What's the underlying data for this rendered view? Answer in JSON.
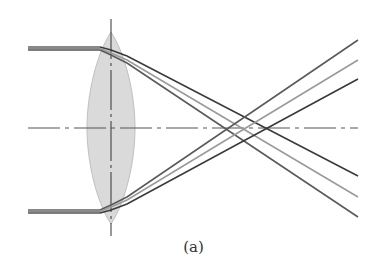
{
  "figure": {
    "caption": "(a)",
    "colors": {
      "lens_fill": "#d4d4d4",
      "lens_stroke": "#b0b0b0",
      "axis": "#555555",
      "incident_beam": "#707070",
      "ray_dark": "#3a3a3a",
      "ray_light": "#9a9a9a",
      "ray_mid": "#5a5a5a"
    },
    "optical_axis": {
      "y": 128,
      "x_start": 28,
      "x_end": 358
    },
    "lens": {
      "cx": 111,
      "cy": 128,
      "rx": 24,
      "ry": 96
    },
    "incident_beams": [
      {
        "name": "top",
        "y": 48,
        "x_start": 28,
        "x_end": 100
      },
      {
        "name": "bottom",
        "y": 211,
        "x_start": 28,
        "x_end": 100
      }
    ],
    "rays": [
      {
        "from": "top",
        "end": [
          358,
          176
        ],
        "tone": "dark"
      },
      {
        "from": "top",
        "end": [
          358,
          197
        ],
        "tone": "light"
      },
      {
        "from": "top",
        "end": [
          358,
          217
        ],
        "tone": "mid"
      },
      {
        "from": "bottom",
        "end": [
          358,
          40
        ],
        "tone": "mid"
      },
      {
        "from": "bottom",
        "end": [
          358,
          60
        ],
        "tone": "light"
      },
      {
        "from": "bottom",
        "end": [
          358,
          79
        ],
        "tone": "dark"
      }
    ]
  }
}
